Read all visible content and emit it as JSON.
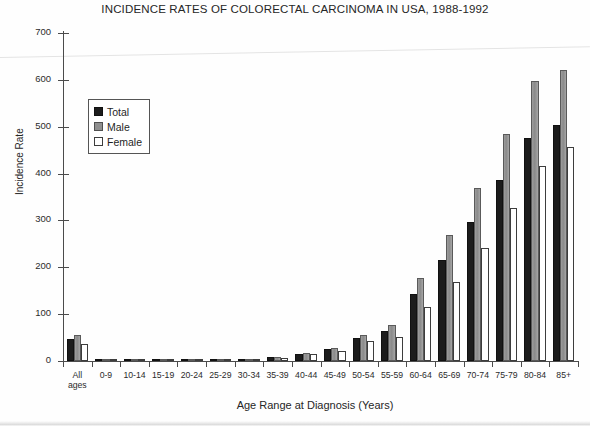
{
  "chart_data": {
    "type": "bar",
    "title": "INCIDENCE RATES OF COLORECTAL CARCINOMA IN USA, 1988-1992",
    "xlabel": "Age Range at Diagnosis (Years)",
    "ylabel": "Incidence Rate",
    "ylim": [
      0,
      700
    ],
    "yticks": [
      0,
      100,
      200,
      300,
      400,
      500,
      600,
      700
    ],
    "grid": false,
    "legend_position": "upper-left-inside",
    "categories": [
      "All\nages",
      "0-9",
      "10-14",
      "15-19",
      "20-24",
      "25-29",
      "30-34",
      "35-39",
      "40-44",
      "45-49",
      "50-54",
      "55-59",
      "60-64",
      "65-69",
      "70-74",
      "75-79",
      "80-84",
      "85+"
    ],
    "series": [
      {
        "name": "Total",
        "color": "#1c1c1c",
        "values": [
          47,
          0.3,
          0.2,
          0.3,
          0.7,
          1.6,
          3.5,
          8,
          16,
          25,
          50,
          64,
          143,
          216,
          297,
          386,
          476,
          503
        ]
      },
      {
        "name": "Male",
        "color": "#8f8f8f",
        "values": [
          55,
          0.3,
          0.2,
          0.3,
          0.8,
          1.7,
          3.8,
          9,
          18,
          28,
          56,
          77,
          177,
          269,
          369,
          485,
          598,
          621
        ]
      },
      {
        "name": "Female",
        "color": "#ffffff",
        "values": [
          36,
          0.3,
          0.2,
          0.3,
          0.7,
          1.5,
          3.2,
          7,
          14,
          21,
          43,
          51,
          115,
          169,
          241,
          327,
          416,
          457
        ]
      }
    ]
  }
}
